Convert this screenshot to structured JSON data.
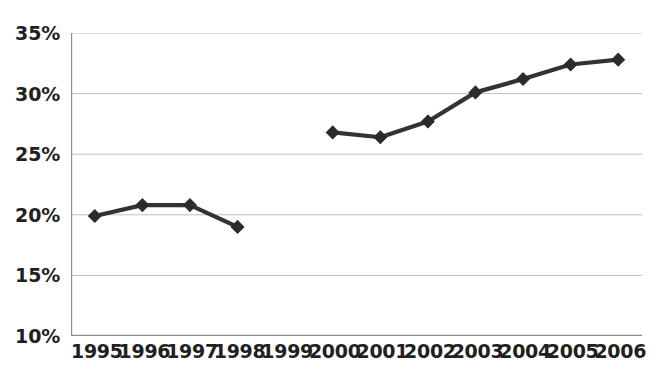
{
  "chart_data": {
    "type": "line",
    "title": "",
    "subtitle": "",
    "xlabel": "",
    "ylabel": "",
    "categories": [
      "1995",
      "1996",
      "1997",
      "1998",
      "1999",
      "2000",
      "2001",
      "2002",
      "2003",
      "2004",
      "2005",
      "2006"
    ],
    "series": [
      {
        "name": "",
        "values": [
          19.9,
          20.8,
          20.8,
          19.0,
          null,
          26.8,
          26.4,
          27.7,
          30.1,
          31.2,
          32.4,
          32.8
        ]
      }
    ],
    "ylim": [
      10,
      35
    ],
    "ytick_values": [
      10,
      15,
      20,
      25,
      30,
      35
    ],
    "ytick_labels": [
      "10%",
      "15%",
      "20%",
      "25%",
      "30%",
      "35%"
    ],
    "xtick_labels": [
      "1995",
      "1996",
      "1997",
      "1998",
      "1999",
      "2000",
      "2001",
      "2002",
      "2003",
      "2004",
      "2005",
      "2006"
    ],
    "grid": true,
    "grid_axis": "y",
    "legend": false,
    "legend_position": "none",
    "missing_data_years": [
      "1999"
    ],
    "annotations": [],
    "marker": "diamond",
    "colors": {
      "line": "#333333",
      "marker": "#2b2b2b",
      "grid": "#bfbfbf",
      "axis": "#8c8c8c",
      "text": "#231f20",
      "background": "#ffffff"
    }
  }
}
